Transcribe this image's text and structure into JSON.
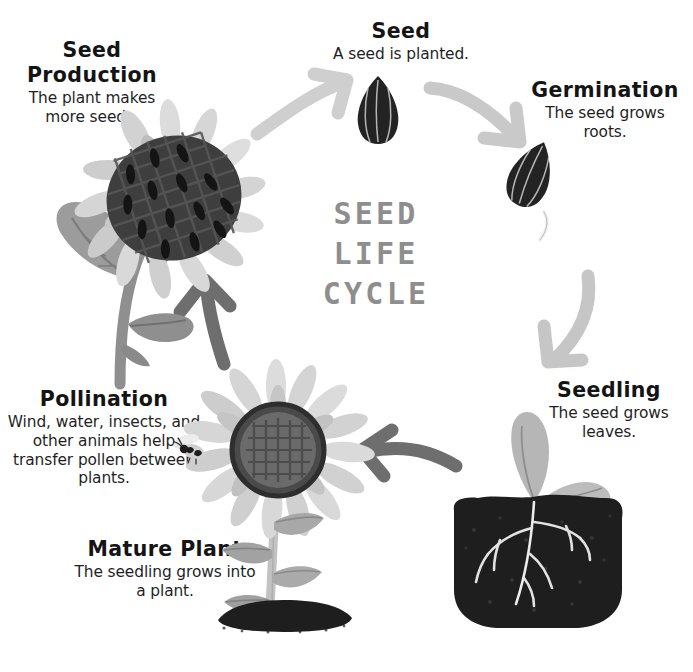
{
  "title": "SEED\nLIFE\nCYCLE",
  "title_color": "#8e8e8e",
  "background_color": "#ffffff",
  "stages": [
    {
      "id": "seed-production",
      "heading": "Seed Production",
      "description": "The plant makes more seeds."
    },
    {
      "id": "seed",
      "heading": "Seed",
      "description": "A seed is planted."
    },
    {
      "id": "germination",
      "heading": "Germination",
      "description": "The seed grows roots."
    },
    {
      "id": "seedling",
      "heading": "Seedling",
      "description": "The seed grows leaves."
    },
    {
      "id": "mature-plant",
      "heading": "Mature Plant",
      "description": "The seedling grows into a plant."
    },
    {
      "id": "pollination",
      "heading": "Pollination",
      "description": "Wind, water, insects, and other animals help transfer pollen between plants."
    }
  ],
  "arrows": [
    {
      "id": "arrow-production-to-seed",
      "color": "#cfcfcf",
      "direction": "up-right"
    },
    {
      "id": "arrow-seed-to-germination",
      "color": "#c9c9c9",
      "direction": "down-right"
    },
    {
      "id": "arrow-germination-to-seedling",
      "color": "#c6c6c6",
      "direction": "down-left"
    },
    {
      "id": "arrow-seedling-to-mature",
      "color": "#6e6e6e",
      "direction": "left"
    },
    {
      "id": "arrow-pollination-to-production",
      "color": "#6e6e6e",
      "direction": "up"
    }
  ],
  "illustrations": [
    {
      "id": "drooping-seed-head-plant",
      "label": "sunflower head full of seeds"
    },
    {
      "id": "sunflower-seed",
      "label": "single sunflower seed"
    },
    {
      "id": "germinating-seed",
      "label": "seed with emerging root"
    },
    {
      "id": "seedling-in-soil",
      "label": "sprout with two cotyledons and roots in soil"
    },
    {
      "id": "mature-sunflower",
      "label": "blooming sunflower with leaves"
    },
    {
      "id": "bee",
      "label": "honey bee pollinator"
    }
  ],
  "palette": {
    "petal_light": "#dcdcdc",
    "petal_mid": "#c4c4c4",
    "leaf_gray": "#9a9a9a",
    "seed_dark": "#262626",
    "soil_dark": "#1e1e1e",
    "center_dark": "#5a5a5a",
    "text_dark": "#141414"
  }
}
